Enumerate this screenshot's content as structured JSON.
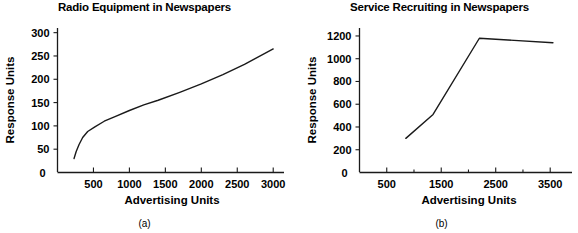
{
  "figure": {
    "panels": [
      {
        "caption": "(a)",
        "title": "Radio Equipment in Newspapers",
        "xlabel": "Advertising Units",
        "ylabel": "Response Units"
      },
      {
        "caption": "(b)",
        "title": "Service Recruiting in Newspapers",
        "xlabel": "Advertising Units",
        "ylabel": "Response Units"
      }
    ],
    "line_color": "#1a1a1a",
    "background_color": "#ffffff"
  },
  "chart_data": [
    {
      "type": "line",
      "title": "Radio Equipment in Newspapers",
      "caption": "(a)",
      "xlabel": "Advertising Units",
      "ylabel": "Response Units",
      "xlim": [
        0,
        3150
      ],
      "ylim": [
        0,
        310
      ],
      "xticks": [
        500,
        1000,
        1500,
        2000,
        2500,
        3000
      ],
      "xtick_labels": [
        "500",
        "1000",
        "1500",
        "2000",
        "2500",
        "3000"
      ],
      "yticks": [
        0,
        50,
        100,
        150,
        200,
        250,
        300
      ],
      "ytick_labels": [
        "0",
        "50",
        "100",
        "150",
        "200",
        "250",
        "300"
      ],
      "grid": false,
      "legend": false,
      "series": [
        {
          "name": "Radio Equipment",
          "x": [
            230,
            260,
            300,
            350,
            420,
            520,
            650,
            800,
            1000,
            1200,
            1400,
            1700,
            2000,
            2300,
            2600,
            3000
          ],
          "y": [
            30,
            45,
            60,
            75,
            88,
            98,
            110,
            120,
            133,
            145,
            155,
            172,
            190,
            210,
            232,
            265
          ]
        }
      ]
    },
    {
      "type": "line",
      "title": "Service Recruiting in Newspapers",
      "caption": "(b)",
      "xlabel": "Advertising Units",
      "ylabel": "Response Units",
      "xlim": [
        0,
        3900
      ],
      "ylim": [
        0,
        1270
      ],
      "xticks": [
        500,
        1500,
        2500,
        3500
      ],
      "xtick_labels": [
        "500",
        "1500",
        "2500",
        "3500"
      ],
      "xminorticks": [
        1000,
        2000,
        3000
      ],
      "yticks": [
        0,
        200,
        400,
        600,
        800,
        1000,
        1200
      ],
      "ytick_labels": [
        "0",
        "200",
        "400",
        "600",
        "800",
        "1000",
        "1200"
      ],
      "grid": false,
      "legend": false,
      "series": [
        {
          "name": "Service Recruiting",
          "x": [
            850,
            1350,
            2200,
            3550
          ],
          "y": [
            300,
            510,
            1180,
            1140
          ]
        }
      ]
    }
  ]
}
